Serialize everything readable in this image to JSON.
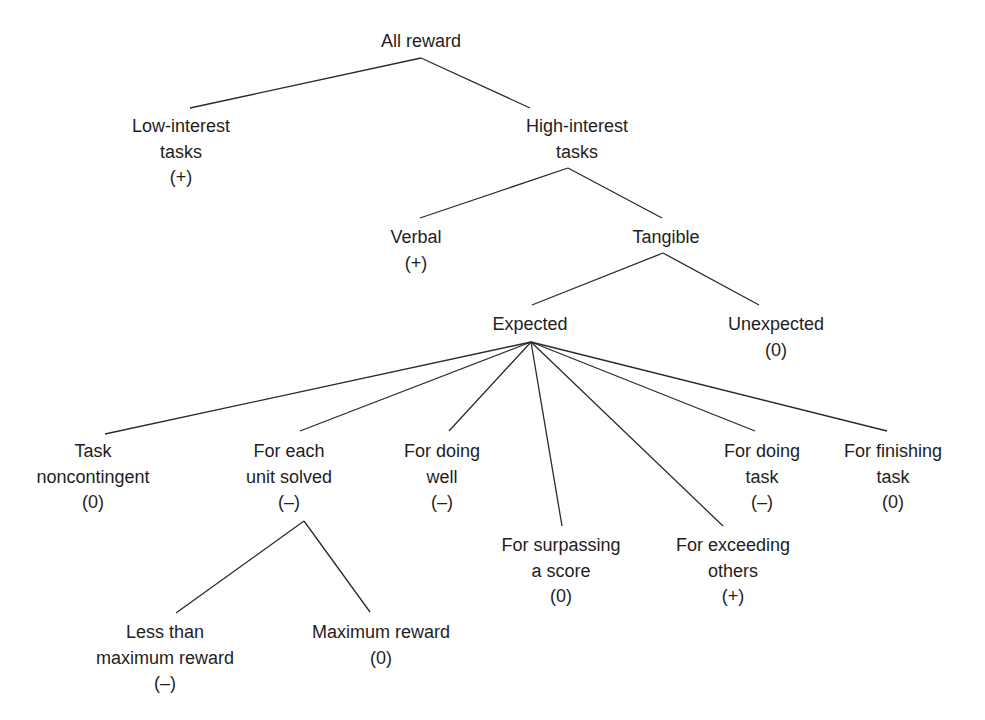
{
  "diagram": {
    "root": {
      "id": "all-reward",
      "lines": [
        "All reward"
      ]
    },
    "nodes": {
      "all_reward": {
        "lines": [
          "All reward"
        ]
      },
      "low_interest": {
        "lines": [
          "Low-interest",
          "tasks",
          "(+)"
        ]
      },
      "high_interest": {
        "lines": [
          "High-interest",
          "tasks"
        ]
      },
      "verbal": {
        "lines": [
          "Verbal",
          "(+)"
        ]
      },
      "tangible": {
        "lines": [
          "Tangible"
        ]
      },
      "expected": {
        "lines": [
          "Expected"
        ]
      },
      "unexpected": {
        "lines": [
          "Unexpected",
          "(0)"
        ]
      },
      "task_noncontingent": {
        "lines": [
          "Task",
          "noncontingent",
          "(0)"
        ]
      },
      "each_unit_solved": {
        "lines": [
          "For each",
          "unit solved",
          "(–)"
        ]
      },
      "doing_well": {
        "lines": [
          "For doing",
          "well",
          "(–)"
        ]
      },
      "surpassing_score": {
        "lines": [
          "For surpassing",
          "a score",
          "(0)"
        ]
      },
      "exceeding_others": {
        "lines": [
          "For exceeding",
          "others",
          "(+)"
        ]
      },
      "doing_task": {
        "lines": [
          "For doing",
          "task",
          "(–)"
        ]
      },
      "finishing_task": {
        "lines": [
          "For finishing",
          "task",
          "(0)"
        ]
      },
      "less_than_max": {
        "lines": [
          "Less than",
          "maximum reward",
          "(–)"
        ]
      },
      "max_reward": {
        "lines": [
          "Maximum reward",
          "(0)"
        ]
      }
    },
    "edges": [
      [
        "all_reward",
        "low_interest"
      ],
      [
        "all_reward",
        "high_interest"
      ],
      [
        "high_interest",
        "verbal"
      ],
      [
        "high_interest",
        "tangible"
      ],
      [
        "tangible",
        "expected"
      ],
      [
        "tangible",
        "unexpected"
      ],
      [
        "expected",
        "task_noncontingent"
      ],
      [
        "expected",
        "each_unit_solved"
      ],
      [
        "expected",
        "doing_well"
      ],
      [
        "expected",
        "surpassing_score"
      ],
      [
        "expected",
        "exceeding_others"
      ],
      [
        "expected",
        "doing_task"
      ],
      [
        "expected",
        "finishing_task"
      ],
      [
        "each_unit_solved",
        "less_than_max"
      ],
      [
        "each_unit_solved",
        "max_reward"
      ]
    ],
    "line_color": "#2a2a2a",
    "text_color": "#1e1e1e"
  }
}
